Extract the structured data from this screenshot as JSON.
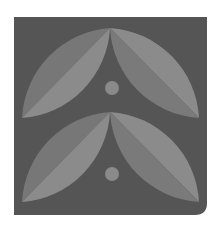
{
  "logo": {
    "name": "leaf-pattern-logo",
    "colors": {
      "page_background": "#ffffff",
      "tile_background": "#555555",
      "leaf_dark": "#777777",
      "leaf_light": "#8b8b8b",
      "dot": "#8a8a8a"
    },
    "tile": {
      "x": 14,
      "y": 17,
      "width": 193,
      "height": 198,
      "corner_radius_bottom_right": 12
    },
    "leaf_pairs": [
      {
        "apex": [
          110,
          28
        ],
        "left_tip": [
          22,
          118
        ],
        "right_tip": [
          199,
          118
        ],
        "dot": {
          "cx": 112,
          "cy": 88,
          "r": 7
        }
      },
      {
        "apex": [
          110,
          112
        ],
        "left_tip": [
          22,
          202
        ],
        "right_tip": [
          199,
          202
        ],
        "dot": {
          "cx": 112,
          "cy": 174,
          "r": 7
        }
      }
    ]
  }
}
